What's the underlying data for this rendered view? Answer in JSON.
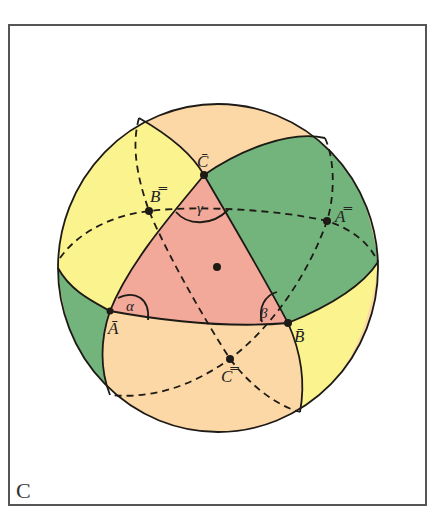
{
  "figure": {
    "panel_label": "C",
    "colors": {
      "triangle_pink": "#f2a99a",
      "green": "#72b47c",
      "yellow": "#fbf38e",
      "peach": "#fbd8a5",
      "line": "#1e1a16",
      "frame": "#555555"
    },
    "vertices": {
      "C_bar": "C̄",
      "A_bar": "Ā",
      "B_bar": "B̄",
      "A_double_bar": "A̿",
      "B_double_bar": "B̿",
      "C_double_bar": "C̿"
    },
    "angles": {
      "alpha": "α",
      "beta": "β",
      "gamma": "γ"
    }
  }
}
